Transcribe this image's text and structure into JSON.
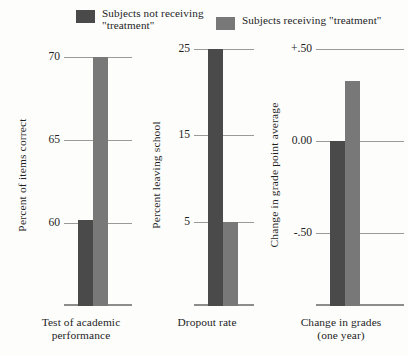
{
  "legend": {
    "entries": [
      {
        "label": "Subjects not receiving\n\"treatment\"",
        "color": "#4a4a4a",
        "key": "control"
      },
      {
        "label": "Subjects receiving \"treatment\"",
        "color": "#787878",
        "key": "treatment"
      }
    ]
  },
  "chart_data": {
    "type": "bar",
    "title": "",
    "xlabel": "",
    "grid": true,
    "legend_position": "top",
    "categories": [
      "Test of academic\nperformance",
      "Dropout rate",
      "Change in grades\n(one year)"
    ],
    "series": [
      {
        "name": "Subjects not receiving \"treatment\"",
        "color": "#4a4a4a",
        "values": [
          60.2,
          25.0,
          0.0
        ]
      },
      {
        "name": "Subjects receiving \"treatment\"",
        "color": "#787878",
        "values": [
          70.0,
          5.0,
          0.33
        ]
      }
    ],
    "panels": [
      {
        "ylabel": "Percent of items correct",
        "ticks": [
          "70",
          "65",
          "60"
        ],
        "tick_values": [
          70,
          65,
          60
        ],
        "ylim": [
          55.0,
          70.8
        ],
        "values": {
          "control": 60.2,
          "treatment": 70.0
        }
      },
      {
        "ylabel": "Percent leaving school",
        "ticks": [
          "25",
          "15",
          "5"
        ],
        "tick_values": [
          25,
          15,
          5
        ],
        "ylim": [
          -4.8,
          25.6
        ],
        "values": {
          "control": 25.0,
          "treatment": 5.0
        }
      },
      {
        "ylabel": "Change in grade point average",
        "ticks": [
          "+.50",
          "0.00",
          "-.50"
        ],
        "tick_values": [
          0.5,
          0.0,
          -0.5
        ],
        "ylim": [
          -0.9,
          0.53
        ],
        "values": {
          "control": 0.0,
          "treatment": 0.33
        }
      }
    ]
  }
}
